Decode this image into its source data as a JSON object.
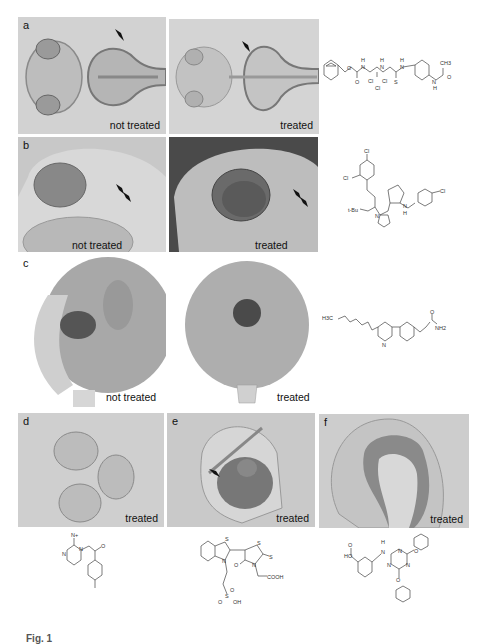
{
  "figure": {
    "panels": [
      {
        "id": "a",
        "label": "a",
        "images": [
          {
            "caption": "not treated"
          },
          {
            "caption": "treated"
          }
        ],
        "compound": "benzyl carbamate thiourea trichloroethyl compound with acetanilide"
      },
      {
        "id": "b",
        "label": "b",
        "images": [
          {
            "caption": "not treated"
          },
          {
            "caption": "treated"
          }
        ],
        "compound": "dichlorophenyl tetrazole cyclopentyl chloroaniline compound"
      },
      {
        "id": "c",
        "label": "c",
        "images": [
          {
            "caption": "not treated"
          },
          {
            "caption": "treated"
          }
        ],
        "compound": "pentyl bipyridyl-phenyl acrylamide"
      },
      {
        "id": "d",
        "label": "d",
        "images": [
          {
            "caption": "treated"
          }
        ],
        "compound": "iminopyrimidinium methylacetophenone"
      },
      {
        "id": "e",
        "label": "e",
        "images": [
          {
            "caption": "treated"
          }
        ],
        "compound": "benzothiazolylidene rhodanine sulfonic acid"
      },
      {
        "id": "f",
        "label": "f",
        "images": [
          {
            "caption": "treated"
          }
        ],
        "compound": "triazine diphenoxy aminobenzoic acid"
      }
    ],
    "chem_labels": {
      "a": {
        "h1": "H",
        "h2": "H",
        "h3": "H",
        "o1": "O",
        "o2": "O",
        "n1": "N",
        "n2": "N",
        "n3": "N",
        "cl1": "Cl",
        "cl2": "Cl",
        "cl3": "Cl",
        "s": "S",
        "ch3": "CH3",
        "nh": "N",
        "h4": "H",
        "o3": "O"
      },
      "b": {
        "cl1": "Cl",
        "cl2": "Cl",
        "cl3": "Cl",
        "tbu": "t-Bu",
        "n": "N",
        "nh": "N",
        "h": "H"
      },
      "c": {
        "h3c": "H3C",
        "n": "N",
        "o": "O",
        "nh2": "NH2"
      },
      "d": {
        "nplus": "N+",
        "n": "N",
        "n2": "N",
        "o": "O"
      },
      "e": {
        "s1": "S",
        "s2": "S",
        "s3": "S",
        "n1": "N",
        "n2": "N",
        "o": "O",
        "cooh": "COOH",
        "so3": "S",
        "o1": "O",
        "o2": "O",
        "oh": "OH"
      },
      "f": {
        "ho": "HO",
        "o": "O",
        "h": "H",
        "n": "N",
        "n1": "N",
        "n2": "N",
        "n3": "N",
        "o1": "O",
        "o2": "O"
      }
    },
    "arrowheads": {
      "a": 2,
      "b": 4,
      "e": 1
    },
    "caption_partial": "Fig. 1"
  }
}
